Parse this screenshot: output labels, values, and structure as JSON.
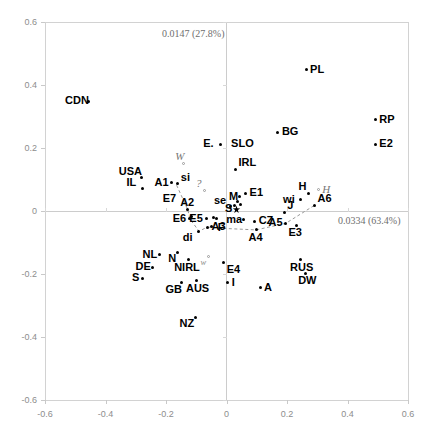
{
  "chart_data": {
    "type": "scatter",
    "title": "",
    "xlabel": "0.0334 (63.4%)",
    "ylabel": "0.0147 (27.8%)",
    "xlim": [
      -0.6,
      0.6
    ],
    "ylim": [
      -0.6,
      0.6
    ],
    "xticks": [
      "-0.6",
      "-0.4",
      "-0.2",
      "0",
      "0.2",
      "0.4",
      "0.6"
    ],
    "xtickvals": [
      -0.6,
      -0.4,
      -0.2,
      0,
      0.2,
      0.4,
      0.6
    ],
    "yticks": [
      "0.6",
      "0.4",
      "0.2",
      "0",
      "-0.2",
      "-0.4",
      "-0.6"
    ],
    "ytickvals": [
      0.6,
      0.4,
      0.2,
      0,
      -0.2,
      -0.4,
      -0.6
    ],
    "grid": false,
    "legend": "none",
    "xlabel_position": "inside-right-of-zero-axis",
    "ylabel_position": "inside-top-of-zero-axis",
    "points": [
      {
        "label": "CDN",
        "x": -0.455,
        "y": 0.349,
        "marker": "filled",
        "style": "bold",
        "lpos": "left"
      },
      {
        "label": "PL",
        "x": 0.263,
        "y": 0.448,
        "marker": "filled",
        "style": "bold",
        "lpos": "right"
      },
      {
        "label": "RP",
        "x": 0.492,
        "y": 0.29,
        "marker": "filled",
        "style": "bold",
        "lpos": "right"
      },
      {
        "label": "BG",
        "x": 0.17,
        "y": 0.25,
        "marker": "filled",
        "style": "bold",
        "lpos": "right"
      },
      {
        "label": "E2",
        "x": 0.492,
        "y": 0.212,
        "marker": "filled",
        "style": "bold",
        "lpos": "right"
      },
      {
        "label": "E.",
        "x": -0.02,
        "y": 0.212,
        "marker": "filled",
        "style": "bold",
        "lpos": "left"
      },
      {
        "label": "SLO",
        "x": 0.002,
        "y": 0.212,
        "marker": "none",
        "style": "bold",
        "lpos": "right"
      },
      {
        "label": "IRL",
        "x": 0.03,
        "y": 0.133,
        "marker": "filled",
        "style": "bold",
        "lpos": "rightup"
      },
      {
        "label": "USA",
        "x": -0.281,
        "y": 0.105,
        "marker": "filled",
        "style": "bold",
        "lpos": "leftup"
      },
      {
        "label": "W",
        "x": -0.141,
        "y": 0.152,
        "marker": "open",
        "style": "ital",
        "lpos": "leftup"
      },
      {
        "label": "A1",
        "x": -0.181,
        "y": 0.09,
        "marker": "filled",
        "style": "bold",
        "lpos": "left"
      },
      {
        "label": "si",
        "x": -0.161,
        "y": 0.086,
        "marker": "filled",
        "style": "bold",
        "lpos": "rightup"
      },
      {
        "label": "IL",
        "x": -0.277,
        "y": 0.07,
        "marker": "filled",
        "style": "bold",
        "lpos": "leftup"
      },
      {
        "label": "?",
        "x": -0.073,
        "y": 0.066,
        "marker": "open",
        "style": "ital",
        "lpos": "leftup"
      },
      {
        "label": "E7",
        "x": -0.186,
        "y": 0.062,
        "marker": "none",
        "style": "bold",
        "lpos": "below"
      },
      {
        "label": "H",
        "x": 0.27,
        "y": 0.056,
        "marker": "filled",
        "style": "bold",
        "lpos": "leftup"
      },
      {
        "label": "H",
        "x": 0.303,
        "y": 0.068,
        "marker": "open",
        "style": "ital",
        "lpos": "right"
      },
      {
        "label": "wi",
        "x": 0.244,
        "y": 0.035,
        "marker": "filled",
        "style": "bold",
        "lpos": "left"
      },
      {
        "label": "M",
        "x": 0.043,
        "y": 0.046,
        "marker": "filled",
        "style": "bold",
        "lpos": "left"
      },
      {
        "label": "E1",
        "x": 0.063,
        "y": 0.056,
        "marker": "filled",
        "style": "bold",
        "lpos": "right"
      },
      {
        "label": "A6",
        "x": 0.291,
        "y": 0.018,
        "marker": "filled",
        "style": "bold",
        "lpos": "rightup"
      },
      {
        "label": "A2",
        "x": -0.128,
        "y": 0.004,
        "marker": "filled",
        "style": "bold",
        "lpos": "above"
      },
      {
        "label": "se",
        "x": 0.012,
        "y": 0.013,
        "marker": "filled",
        "style": "bold",
        "lpos": "leftup"
      },
      {
        "label": "S",
        "x": 0.03,
        "y": 0.007,
        "marker": "star",
        "style": "bold",
        "lpos": "left"
      },
      {
        "label": "J",
        "x": 0.191,
        "y": -0.004,
        "marker": "filled",
        "style": "bold",
        "lpos": "rightup"
      },
      {
        "label": "E6",
        "x": -0.121,
        "y": -0.025,
        "marker": "filled",
        "style": "bold",
        "lpos": "left"
      },
      {
        "label": "E5",
        "x": -0.066,
        "y": -0.025,
        "marker": "filled",
        "style": "bold",
        "lpos": "left"
      },
      {
        "label": "ma",
        "x": 0.056,
        "y": -0.027,
        "marker": "filled",
        "style": "bold",
        "lpos": "left"
      },
      {
        "label": "CZ",
        "x": 0.093,
        "y": -0.033,
        "marker": "filled",
        "style": "bold",
        "lpos": "right"
      },
      {
        "label": "A5",
        "x": 0.196,
        "y": -0.039,
        "marker": "filled",
        "style": "bold",
        "lpos": "left"
      },
      {
        "label": "E3",
        "x": 0.23,
        "y": -0.045,
        "marker": "filled",
        "style": "bold",
        "lpos": "below"
      },
      {
        "label": "A3",
        "x": -0.063,
        "y": -0.051,
        "marker": "filled",
        "style": "bold",
        "lpos": "right"
      },
      {
        "label": "F",
        "x": -0.015,
        "y": -0.055,
        "marker": "none",
        "style": "bold",
        "lpos": "center"
      },
      {
        "label": "A4",
        "x": 0.098,
        "y": -0.06,
        "marker": "filled",
        "style": "bold",
        "lpos": "below"
      },
      {
        "label": "di",
        "x": -0.091,
        "y": -0.064,
        "marker": "filled",
        "style": "bold",
        "lpos": "leftdown"
      },
      {
        "label": "NL",
        "x": -0.221,
        "y": -0.139,
        "marker": "filled",
        "style": "bold",
        "lpos": "left"
      },
      {
        "label": "N",
        "x": -0.161,
        "y": -0.131,
        "marker": "filled",
        "style": "bold",
        "lpos": "leftdown"
      },
      {
        "label": "RUS",
        "x": 0.246,
        "y": -0.155,
        "marker": "filled",
        "style": "bold",
        "lpos": "below"
      },
      {
        "label": "E4",
        "x": -0.009,
        "y": -0.165,
        "marker": "filled",
        "style": "bold",
        "lpos": "rightdown"
      },
      {
        "label": "NIRL",
        "x": -0.126,
        "y": -0.155,
        "marker": "filled",
        "style": "bold",
        "lpos": "below"
      },
      {
        "label": "w",
        "x": -0.058,
        "y": -0.145,
        "marker": "open",
        "style": "ital-sm",
        "lpos": "leftdown"
      },
      {
        "label": "DE",
        "x": -0.244,
        "y": -0.178,
        "marker": "filled",
        "style": "bold",
        "lpos": "left"
      },
      {
        "label": "DW",
        "x": 0.262,
        "y": -0.197,
        "marker": "filled",
        "style": "bold",
        "lpos": "below"
      },
      {
        "label": "S",
        "x": -0.277,
        "y": -0.213,
        "marker": "filled",
        "style": "bold",
        "lpos": "left"
      },
      {
        "label": "I",
        "x": 0.004,
        "y": -0.228,
        "marker": "filled",
        "style": "bold",
        "lpos": "right"
      },
      {
        "label": "GB",
        "x": -0.148,
        "y": -0.228,
        "marker": "filled",
        "style": "bold",
        "lpos": "leftdown"
      },
      {
        "label": "AUS",
        "x": -0.098,
        "y": -0.222,
        "marker": "filled",
        "style": "bold",
        "lpos": "below"
      },
      {
        "label": "A",
        "x": 0.111,
        "y": -0.243,
        "marker": "filled",
        "style": "bold",
        "lpos": "right"
      },
      {
        "label": "NZ",
        "x": -0.102,
        "y": -0.338,
        "marker": "filled",
        "style": "bold",
        "lpos": "leftdown"
      }
    ],
    "extra_points": [
      {
        "x": -0.042,
        "y": -0.022,
        "marker": "filled"
      },
      {
        "x": -0.033,
        "y": -0.024,
        "marker": "filled"
      },
      {
        "x": 0.037,
        "y": 0.03,
        "marker": "filled"
      },
      {
        "x": 0.046,
        "y": 0.022,
        "marker": "filled"
      },
      {
        "x": 0.027,
        "y": 0.018,
        "marker": "filled"
      },
      {
        "x": -0.05,
        "y": -0.048,
        "marker": "filled"
      },
      {
        "x": -0.115,
        "y": -0.016,
        "marker": "filled"
      }
    ],
    "dashed_path": [
      {
        "x": -0.165,
        "y": 0.082
      },
      {
        "x": -0.128,
        "y": 0.004
      },
      {
        "x": -0.121,
        "y": -0.025
      },
      {
        "x": -0.091,
        "y": -0.064
      },
      {
        "x": -0.063,
        "y": -0.051
      },
      {
        "x": -0.015,
        "y": -0.055
      },
      {
        "x": 0.098,
        "y": -0.06
      },
      {
        "x": 0.196,
        "y": -0.039
      },
      {
        "x": 0.291,
        "y": 0.018
      }
    ],
    "colors": {
      "point": "#000000",
      "open_point": "#9a9a9a",
      "axis": "#c9c9c9",
      "tick_label": "#8d8d8d",
      "caption": "#6e6e6e",
      "dashed_path": "#888888"
    }
  }
}
